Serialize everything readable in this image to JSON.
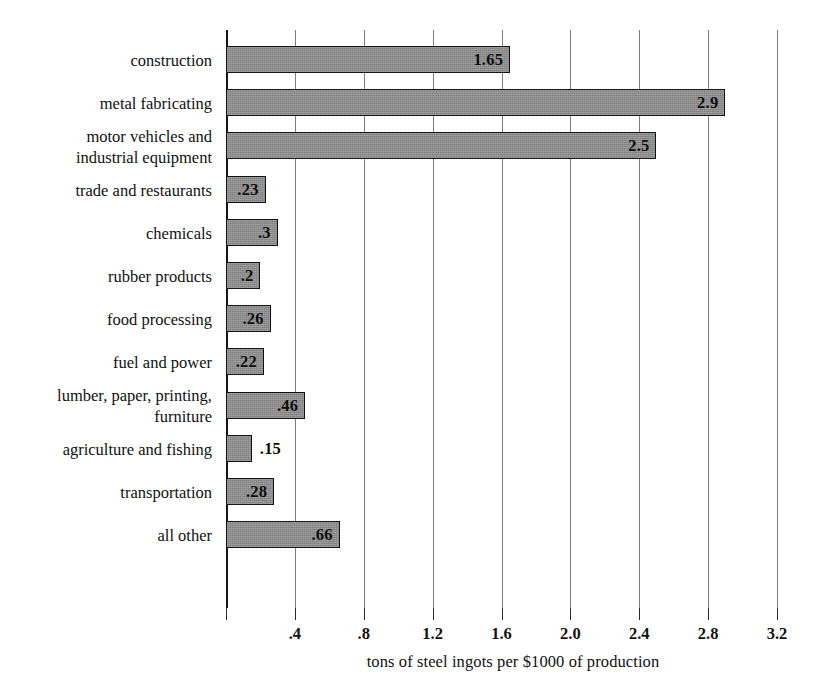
{
  "chart_data": {
    "type": "bar",
    "orientation": "horizontal",
    "title": "",
    "xlabel": "tons of steel ingots per $1000 of production",
    "ylabel": "",
    "xlim": [
      0,
      3.2
    ],
    "xticks": [
      0.4,
      0.8,
      1.2,
      1.6,
      2.0,
      2.4,
      2.8,
      3.2
    ],
    "xtick_labels": [
      ".4",
      ".8",
      "1.2",
      "1.6",
      "2.0",
      "2.4",
      "2.8",
      "3.2"
    ],
    "grid": "vertical",
    "legend": "none",
    "categories": [
      "construction",
      "metal fabricating",
      "motor vehicles and\nindustrial equipment",
      "trade and restaurants",
      "chemicals",
      "rubber products",
      "food processing",
      "fuel and power",
      "lumber, paper, printing,\nfurniture",
      "agriculture and fishing",
      "transportation",
      "all other"
    ],
    "values": [
      1.65,
      2.9,
      2.5,
      0.23,
      0.3,
      0.2,
      0.26,
      0.22,
      0.46,
      0.15,
      0.28,
      0.66
    ],
    "value_labels": [
      "1.65",
      "2.9",
      "2.5",
      ".23",
      ".3",
      ".2",
      ".26",
      ".22",
      ".46",
      ".15",
      ".28",
      ".66"
    ],
    "label_placement": [
      "inside",
      "inside",
      "inside",
      "inside",
      "inside",
      "inside",
      "inside",
      "inside",
      "inside",
      "outside",
      "inside",
      "inside"
    ],
    "colors": {
      "bar_fill": "#8c8c8c",
      "bar_border": "#131313",
      "gridline": "#7c7c80",
      "axis": "#151515",
      "text": "#111111",
      "background": "#ffffff"
    }
  }
}
